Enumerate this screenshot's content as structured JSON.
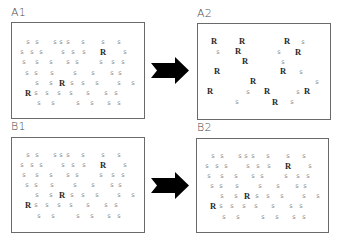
{
  "figure": {
    "panels": [
      {
        "id": "A1",
        "label": "A1",
        "letters": [
          [
            "s",
            28,
            42
          ],
          [
            "s",
            37,
            42
          ],
          [
            "s",
            55,
            42
          ],
          [
            "s",
            61,
            42
          ],
          [
            "s",
            68,
            42
          ],
          [
            "s",
            83,
            42
          ],
          [
            "s",
            103,
            42
          ],
          [
            "s",
            119,
            42
          ],
          [
            "s",
            22,
            52
          ],
          [
            "s",
            32,
            52
          ],
          [
            "s",
            41,
            52
          ],
          [
            "s",
            63,
            52
          ],
          [
            "s",
            73,
            52
          ],
          [
            "s",
            84,
            52
          ],
          [
            "R",
            103,
            52
          ],
          [
            "s",
            125,
            52
          ],
          [
            "s",
            24,
            62
          ],
          [
            "s",
            37,
            62
          ],
          [
            "s",
            51,
            62
          ],
          [
            "s",
            68,
            62
          ],
          [
            "s",
            77,
            62
          ],
          [
            "s",
            101,
            62
          ],
          [
            "s",
            113,
            62
          ],
          [
            "s",
            123,
            62
          ],
          [
            "s",
            27,
            73
          ],
          [
            "s",
            36,
            73
          ],
          [
            "s",
            52,
            73
          ],
          [
            "s",
            75,
            73
          ],
          [
            "s",
            93,
            73
          ],
          [
            "s",
            112,
            73
          ],
          [
            "s",
            120,
            73
          ],
          [
            "s",
            37,
            83
          ],
          [
            "s",
            51,
            83
          ],
          [
            "R",
            62,
            83
          ],
          [
            "s",
            72,
            83
          ],
          [
            "s",
            83,
            83
          ],
          [
            "s",
            97,
            83
          ],
          [
            "s",
            119,
            83
          ],
          [
            "s",
            133,
            83
          ],
          [
            "R",
            28,
            93
          ],
          [
            "s",
            36,
            93
          ],
          [
            "s",
            47,
            93
          ],
          [
            "s",
            59,
            93
          ],
          [
            "s",
            71,
            93
          ],
          [
            "s",
            88,
            93
          ],
          [
            "s",
            106,
            93
          ],
          [
            "s",
            116,
            93
          ],
          [
            "s",
            39,
            103
          ],
          [
            "s",
            53,
            103
          ],
          [
            "s",
            78,
            103
          ],
          [
            "s",
            92,
            103
          ],
          [
            "s",
            109,
            103
          ],
          [
            "s",
            119,
            103
          ]
        ]
      },
      {
        "id": "A2",
        "label": "A2",
        "letters": [
          [
            "R",
            214,
            41
          ],
          [
            "R",
            242,
            41
          ],
          [
            "R",
            287,
            41
          ],
          [
            "s",
            303,
            42
          ],
          [
            "s",
            218,
            52
          ],
          [
            "R",
            238,
            51
          ],
          [
            "s",
            279,
            52
          ],
          [
            "R",
            298,
            52
          ],
          [
            "R",
            245,
            61
          ],
          [
            "s",
            283,
            62
          ],
          [
            "R",
            217,
            71
          ],
          [
            "R",
            283,
            71
          ],
          [
            "s",
            301,
            72
          ],
          [
            "R",
            253,
            81
          ],
          [
            "s",
            317,
            82
          ],
          [
            "R",
            210,
            91
          ],
          [
            "s",
            248,
            92
          ],
          [
            "R",
            267,
            91
          ],
          [
            "s",
            298,
            92
          ],
          [
            "R",
            307,
            91
          ],
          [
            "s",
            237,
            102
          ],
          [
            "R",
            275,
            102
          ],
          [
            "s",
            292,
            102
          ]
        ]
      },
      {
        "id": "B1",
        "label": "B1",
        "letters": [
          [
            "s",
            28,
            155
          ],
          [
            "s",
            37,
            155
          ],
          [
            "s",
            55,
            155
          ],
          [
            "s",
            61,
            155
          ],
          [
            "s",
            68,
            155
          ],
          [
            "s",
            83,
            155
          ],
          [
            "s",
            103,
            155
          ],
          [
            "s",
            119,
            155
          ],
          [
            "s",
            22,
            165
          ],
          [
            "s",
            32,
            165
          ],
          [
            "s",
            41,
            165
          ],
          [
            "s",
            63,
            165
          ],
          [
            "s",
            73,
            165
          ],
          [
            "s",
            84,
            165
          ],
          [
            "R",
            103,
            165
          ],
          [
            "s",
            125,
            165
          ],
          [
            "s",
            24,
            175
          ],
          [
            "s",
            37,
            175
          ],
          [
            "s",
            51,
            175
          ],
          [
            "s",
            68,
            175
          ],
          [
            "s",
            77,
            175
          ],
          [
            "s",
            101,
            175
          ],
          [
            "s",
            113,
            175
          ],
          [
            "s",
            123,
            175
          ],
          [
            "s",
            27,
            185
          ],
          [
            "s",
            36,
            185
          ],
          [
            "s",
            52,
            185
          ],
          [
            "s",
            75,
            185
          ],
          [
            "s",
            93,
            185
          ],
          [
            "s",
            112,
            185
          ],
          [
            "s",
            120,
            185
          ],
          [
            "s",
            37,
            195
          ],
          [
            "s",
            51,
            195
          ],
          [
            "R",
            62,
            195
          ],
          [
            "s",
            72,
            195
          ],
          [
            "s",
            83,
            195
          ],
          [
            "s",
            97,
            195
          ],
          [
            "s",
            119,
            195
          ],
          [
            "s",
            133,
            195
          ],
          [
            "R",
            28,
            205
          ],
          [
            "s",
            36,
            205
          ],
          [
            "s",
            47,
            205
          ],
          [
            "s",
            59,
            205
          ],
          [
            "s",
            71,
            205
          ],
          [
            "s",
            88,
            205
          ],
          [
            "s",
            106,
            205
          ],
          [
            "s",
            116,
            205
          ],
          [
            "s",
            39,
            216
          ],
          [
            "s",
            53,
            216
          ],
          [
            "s",
            78,
            216
          ],
          [
            "s",
            92,
            216
          ],
          [
            "s",
            109,
            216
          ],
          [
            "s",
            119,
            216
          ]
        ]
      },
      {
        "id": "B2",
        "label": "B2",
        "letters": [
          [
            "s",
            213,
            156
          ],
          [
            "s",
            222,
            156
          ],
          [
            "s",
            240,
            156
          ],
          [
            "s",
            246,
            156
          ],
          [
            "s",
            253,
            156
          ],
          [
            "s",
            268,
            156
          ],
          [
            "s",
            288,
            156
          ],
          [
            "s",
            304,
            156
          ],
          [
            "s",
            207,
            166
          ],
          [
            "s",
            217,
            166
          ],
          [
            "s",
            226,
            166
          ],
          [
            "s",
            248,
            166
          ],
          [
            "s",
            258,
            166
          ],
          [
            "s",
            269,
            166
          ],
          [
            "R",
            288,
            166
          ],
          [
            "s",
            310,
            166
          ],
          [
            "s",
            209,
            176
          ],
          [
            "s",
            222,
            176
          ],
          [
            "s",
            236,
            176
          ],
          [
            "s",
            253,
            176
          ],
          [
            "s",
            262,
            176
          ],
          [
            "s",
            286,
            176
          ],
          [
            "s",
            298,
            176
          ],
          [
            "s",
            308,
            176
          ],
          [
            "s",
            212,
            186
          ],
          [
            "s",
            221,
            186
          ],
          [
            "s",
            237,
            186
          ],
          [
            "s",
            260,
            186
          ],
          [
            "s",
            278,
            186
          ],
          [
            "s",
            297,
            186
          ],
          [
            "s",
            305,
            186
          ],
          [
            "s",
            222,
            196
          ],
          [
            "s",
            236,
            196
          ],
          [
            "R",
            247,
            196
          ],
          [
            "s",
            257,
            196
          ],
          [
            "s",
            268,
            196
          ],
          [
            "s",
            282,
            196
          ],
          [
            "s",
            304,
            196
          ],
          [
            "s",
            318,
            196
          ],
          [
            "R",
            213,
            206
          ],
          [
            "s",
            221,
            206
          ],
          [
            "s",
            232,
            206
          ],
          [
            "s",
            244,
            206
          ],
          [
            "s",
            256,
            206
          ],
          [
            "s",
            273,
            206
          ],
          [
            "s",
            291,
            206
          ],
          [
            "s",
            301,
            206
          ],
          [
            "s",
            224,
            217
          ],
          [
            "s",
            238,
            217
          ],
          [
            "s",
            263,
            217
          ],
          [
            "s",
            277,
            217
          ],
          [
            "s",
            294,
            217
          ],
          [
            "s",
            304,
            217
          ]
        ]
      }
    ],
    "arrows": [
      {
        "id": "arrow-a",
        "from": "A1",
        "to": "A2",
        "color": "#000000"
      },
      {
        "id": "arrow-b",
        "from": "B1",
        "to": "B2",
        "color": "#000000"
      }
    ],
    "colors": {
      "s_letter": "#8a8a8a",
      "R_letter": "#2a2a2a",
      "border": "#6a6a6a",
      "label": "#4a4a4a"
    }
  }
}
